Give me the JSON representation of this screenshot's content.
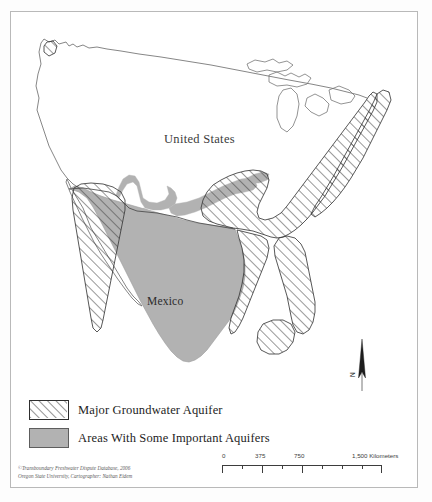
{
  "map": {
    "labels": [
      {
        "name": "united-states",
        "text": "United States"
      },
      {
        "name": "mexico",
        "text": "Mexico"
      }
    ],
    "north_arrow_label": "N",
    "colors": {
      "aquifer_gray": "#b2b2b2",
      "outline": "#555555",
      "hatch_line": "#3a3a3a",
      "frame": "#b9b9b9"
    }
  },
  "legend": {
    "items": [
      {
        "name": "major-groundwater-aquifer",
        "label": "Major Groundwater Aquifer",
        "symbol": "hatch"
      },
      {
        "name": "areas-with-some-important-aquifers",
        "label": "Areas With Some Important Aquifers",
        "symbol": "gray-fill"
      }
    ]
  },
  "scale_bar": {
    "ticks": [
      "0",
      "375",
      "750",
      "1,500 Kilometers"
    ],
    "unit": "Kilometers"
  },
  "credit": {
    "line1": "©Transboundary Freshwater Dispute Database, 2006",
    "line2": "Oregon State University, Cartographer: Nathan Eidem"
  }
}
